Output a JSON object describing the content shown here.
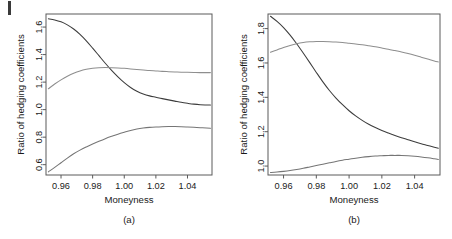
{
  "figure": {
    "background": "#ffffff",
    "axis_color": "#5a5a5a",
    "text_color": "#1a1a1a"
  },
  "chart_data": [
    {
      "type": "line",
      "panel": "(a)",
      "title": "",
      "xlabel": "Moneyness",
      "ylabel": "Ratio of hedging coefficients",
      "xlim": [
        0.9505,
        1.0555
      ],
      "ylim": [
        0.525,
        1.695
      ],
      "xticks": [
        0.96,
        0.98,
        1.0,
        1.02,
        1.04
      ],
      "xticklabels": [
        "0.96",
        "0.98",
        "1.00",
        "1.02",
        "1.04"
      ],
      "yticks": [
        0.6,
        0.8,
        1.0,
        1.2,
        1.4,
        1.6
      ],
      "yticklabels": [
        "0.6",
        "0.8",
        "1.0",
        "1.2",
        "1.4",
        "1.6"
      ],
      "grid": false,
      "legend": "none",
      "series": [
        {
          "name": "estimate",
          "color": "#3c3c3c",
          "x": [
            0.952,
            0.956,
            0.96,
            0.964,
            0.968,
            0.972,
            0.976,
            0.98,
            0.984,
            0.988,
            0.992,
            0.996,
            1.0,
            1.004,
            1.008,
            1.012,
            1.016,
            1.02,
            1.024,
            1.028,
            1.032,
            1.036,
            1.04,
            1.044,
            1.048,
            1.052,
            1.0545
          ],
          "values": [
            1.66,
            1.652,
            1.638,
            1.616,
            1.586,
            1.547,
            1.5,
            1.447,
            1.392,
            1.337,
            1.285,
            1.238,
            1.196,
            1.161,
            1.134,
            1.114,
            1.1,
            1.09,
            1.08,
            1.071,
            1.062,
            1.053,
            1.046,
            1.04,
            1.036,
            1.034,
            1.033
          ]
        },
        {
          "name": "upper-band",
          "color": "#8e8e8e",
          "x": [
            0.952,
            0.956,
            0.96,
            0.964,
            0.968,
            0.972,
            0.976,
            0.98,
            0.984,
            0.988,
            0.992,
            0.996,
            1.0,
            1.004,
            1.008,
            1.012,
            1.016,
            1.02,
            1.024,
            1.028,
            1.032,
            1.036,
            1.04,
            1.044,
            1.048,
            1.052,
            1.0545
          ],
          "values": [
            1.152,
            1.186,
            1.216,
            1.242,
            1.264,
            1.281,
            1.293,
            1.301,
            1.305,
            1.306,
            1.305,
            1.303,
            1.3,
            1.296,
            1.292,
            1.288,
            1.284,
            1.281,
            1.278,
            1.276,
            1.274,
            1.272,
            1.271,
            1.27,
            1.269,
            1.269,
            1.269
          ]
        },
        {
          "name": "lower-band",
          "color": "#757575",
          "x": [
            0.952,
            0.956,
            0.96,
            0.964,
            0.968,
            0.972,
            0.976,
            0.98,
            0.984,
            0.988,
            0.992,
            0.996,
            1.0,
            1.004,
            1.008,
            1.012,
            1.016,
            1.02,
            1.024,
            1.028,
            1.032,
            1.036,
            1.04,
            1.044,
            1.048,
            1.052,
            1.0545
          ],
          "values": [
            0.548,
            0.58,
            0.614,
            0.648,
            0.679,
            0.706,
            0.729,
            0.75,
            0.77,
            0.789,
            0.806,
            0.822,
            0.836,
            0.849,
            0.859,
            0.866,
            0.871,
            0.874,
            0.876,
            0.877,
            0.877,
            0.876,
            0.874,
            0.872,
            0.869,
            0.866,
            0.864
          ]
        }
      ]
    },
    {
      "type": "line",
      "panel": "(b)",
      "title": "",
      "xlabel": "Moneyness",
      "ylabel": "Ratio of hedging coefficients",
      "xlim": [
        0.9505,
        1.0555
      ],
      "ylim": [
        0.948,
        1.885
      ],
      "xticks": [
        0.96,
        0.98,
        1.0,
        1.02,
        1.04
      ],
      "xticklabels": [
        "0.96",
        "0.98",
        "1.00",
        "1.02",
        "1.04"
      ],
      "yticks": [
        1.0,
        1.2,
        1.4,
        1.6,
        1.8
      ],
      "yticklabels": [
        "1.0",
        "1.2",
        "1.4",
        "1.6",
        "1.8"
      ],
      "grid": false,
      "legend": "none",
      "series": [
        {
          "name": "estimate",
          "color": "#3c3c3c",
          "x": [
            0.952,
            0.956,
            0.96,
            0.964,
            0.968,
            0.972,
            0.976,
            0.98,
            0.984,
            0.988,
            0.992,
            0.996,
            1.0,
            1.004,
            1.008,
            1.012,
            1.016,
            1.02,
            1.024,
            1.028,
            1.032,
            1.036,
            1.04,
            1.044,
            1.048,
            1.052,
            1.0545
          ],
          "values": [
            1.872,
            1.842,
            1.806,
            1.762,
            1.712,
            1.658,
            1.602,
            1.545,
            1.49,
            1.44,
            1.396,
            1.357,
            1.322,
            1.292,
            1.266,
            1.243,
            1.224,
            1.207,
            1.192,
            1.178,
            1.165,
            1.153,
            1.141,
            1.13,
            1.12,
            1.11,
            1.104
          ]
        },
        {
          "name": "upper-band",
          "color": "#8e8e8e",
          "x": [
            0.952,
            0.956,
            0.96,
            0.964,
            0.968,
            0.972,
            0.976,
            0.98,
            0.984,
            0.988,
            0.992,
            0.996,
            1.0,
            1.004,
            1.008,
            1.012,
            1.016,
            1.02,
            1.024,
            1.028,
            1.032,
            1.036,
            1.04,
            1.044,
            1.048,
            1.052,
            1.0545
          ],
          "values": [
            1.662,
            1.676,
            1.69,
            1.702,
            1.712,
            1.719,
            1.723,
            1.725,
            1.725,
            1.724,
            1.722,
            1.719,
            1.715,
            1.711,
            1.706,
            1.7,
            1.694,
            1.687,
            1.68,
            1.672,
            1.664,
            1.655,
            1.645,
            1.634,
            1.623,
            1.612,
            1.606
          ]
        },
        {
          "name": "lower-band",
          "color": "#757575",
          "x": [
            0.952,
            0.956,
            0.96,
            0.964,
            0.968,
            0.972,
            0.976,
            0.98,
            0.984,
            0.988,
            0.992,
            0.996,
            1.0,
            1.004,
            1.008,
            1.012,
            1.016,
            1.02,
            1.024,
            1.028,
            1.032,
            1.036,
            1.04,
            1.044,
            1.048,
            1.052,
            1.0545
          ],
          "values": [
            0.962,
            0.965,
            0.969,
            0.974,
            0.98,
            0.987,
            0.995,
            1.003,
            1.011,
            1.019,
            1.027,
            1.034,
            1.04,
            1.046,
            1.051,
            1.055,
            1.058,
            1.06,
            1.062,
            1.062,
            1.062,
            1.06,
            1.057,
            1.053,
            1.048,
            1.042,
            1.038
          ]
        }
      ]
    }
  ]
}
